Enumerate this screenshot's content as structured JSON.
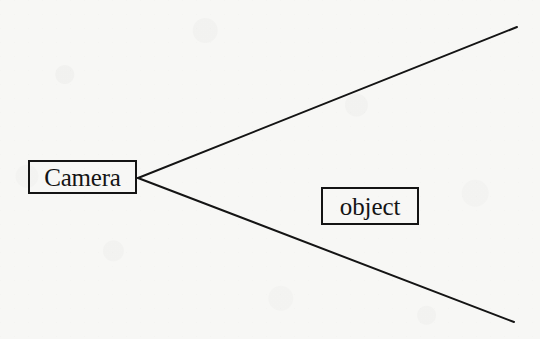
{
  "figure": {
    "kind": "line-diagram",
    "background_color": "#f7f7f5",
    "ink_color": "#141414"
  },
  "nodes": [
    {
      "id": "camera",
      "label": "Camera",
      "shape": "rectangle",
      "x": 28,
      "y": 160,
      "width": 109,
      "height": 34
    },
    {
      "id": "object",
      "label": "object",
      "shape": "rectangle",
      "x": 321,
      "y": 187,
      "width": 98,
      "height": 38
    }
  ],
  "rays": {
    "apex": {
      "x": 138,
      "y": 178
    },
    "stroke_color": "#141414",
    "stroke_width": 2,
    "lines": [
      {
        "id": "upper-ray",
        "x1": 138,
        "y1": 178,
        "x2": 517,
        "y2": 27
      },
      {
        "id": "lower-ray",
        "x1": 138,
        "y1": 178,
        "x2": 514,
        "y2": 322
      }
    ]
  },
  "labels": {
    "camera": "Camera",
    "object": "object"
  }
}
